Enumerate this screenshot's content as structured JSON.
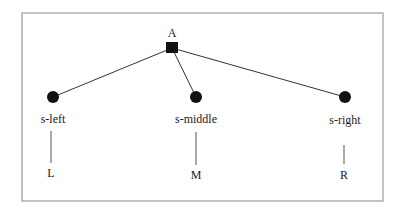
{
  "diagram": {
    "type": "tree",
    "root": {
      "label": "A",
      "shape": "square",
      "x": 172,
      "y": 48
    },
    "children": [
      {
        "id": "left",
        "node_label": "s-left",
        "leaf_label": "L",
        "x": 53,
        "y": 97
      },
      {
        "id": "middle",
        "node_label": "s-middle",
        "leaf_label": "M",
        "x": 196,
        "y": 97
      },
      {
        "id": "right",
        "node_label": "s-right",
        "leaf_label": "R",
        "x": 345,
        "y": 97
      }
    ],
    "colors": {
      "frame": "#9a9a9a",
      "edges": "#333333",
      "nodes": "#111111",
      "text": "#1a1a1a"
    }
  }
}
